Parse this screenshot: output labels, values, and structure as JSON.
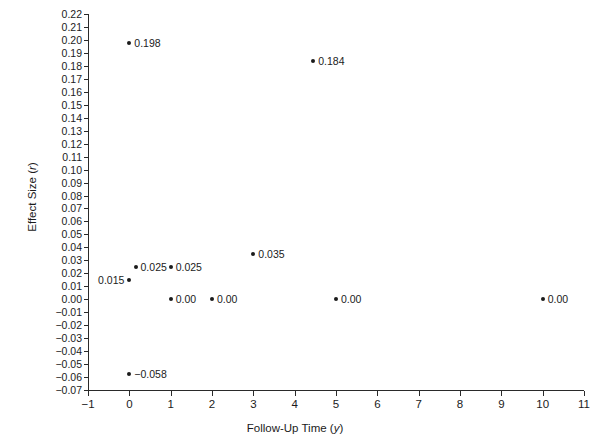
{
  "chart_data": {
    "type": "scatter",
    "title": "",
    "xlabel": "Follow-Up Time (y)",
    "xlabel_text": "Follow-Up Time (",
    "xlabel_var": "y",
    "xlabel_close": ")",
    "ylabel": "Effect Size (r)",
    "ylabel_text": "Effect Size (",
    "ylabel_var": "r",
    "ylabel_close": ")",
    "xlim": [
      -1,
      11
    ],
    "ylim": [
      -0.07,
      0.22
    ],
    "grid": false,
    "legend": false,
    "marker_color": "#1b1b1b",
    "axis_color": "#2a2a2a",
    "background": "#ffffff",
    "xticks": [
      -1,
      0,
      1,
      2,
      3,
      4,
      5,
      6,
      7,
      8,
      9,
      10,
      11
    ],
    "xtick_labels": [
      "−1",
      "0",
      "1",
      "2",
      "3",
      "4",
      "5",
      "6",
      "7",
      "8",
      "9",
      "10",
      "11"
    ],
    "yticks": [
      0.22,
      0.21,
      0.2,
      0.19,
      0.18,
      0.17,
      0.16,
      0.15,
      0.14,
      0.13,
      0.12,
      0.11,
      0.1,
      0.09,
      0.08,
      0.07,
      0.06,
      0.05,
      0.04,
      0.03,
      0.02,
      0.01,
      0.0,
      -0.01,
      -0.02,
      -0.03,
      -0.04,
      -0.05,
      -0.06,
      -0.07
    ],
    "ytick_labels": [
      "0.22",
      "0.21",
      "0.20",
      "0.19",
      "0.18",
      "0.17",
      "0.16",
      "0.15",
      "0.14",
      "0.13",
      "0.12",
      "0.11",
      "0.10",
      "0.09",
      "0.08",
      "0.07",
      "0.06",
      "0.05",
      "0.04",
      "0.03",
      "0.02",
      "0.01",
      "0.00",
      "−0.01",
      "−0.02",
      "−0.03",
      "−0.04",
      "−0.05",
      "−0.06",
      "−0.07"
    ],
    "points": [
      {
        "x": 0.0,
        "y": 0.198,
        "label": "0.198",
        "label_side": "right"
      },
      {
        "x": 4.45,
        "y": 0.184,
        "label": "0.184",
        "label_side": "right"
      },
      {
        "x": 3.0,
        "y": 0.035,
        "label": "0.035",
        "label_side": "right"
      },
      {
        "x": 0.15,
        "y": 0.025,
        "label": "0.025",
        "label_side": "right"
      },
      {
        "x": 1.0,
        "y": 0.025,
        "label": "0.025",
        "label_side": "right"
      },
      {
        "x": 0.0,
        "y": 0.015,
        "label": "0.015",
        "label_side": "left"
      },
      {
        "x": 1.0,
        "y": 0.0,
        "label": "0.00",
        "label_side": "right"
      },
      {
        "x": 2.0,
        "y": 0.0,
        "label": "0.00",
        "label_side": "right"
      },
      {
        "x": 5.0,
        "y": 0.0,
        "label": "0.00",
        "label_side": "right"
      },
      {
        "x": 10.0,
        "y": 0.0,
        "label": "0.00",
        "label_side": "right"
      },
      {
        "x": 0.0,
        "y": -0.058,
        "label": "−0.058",
        "label_side": "right"
      }
    ]
  }
}
